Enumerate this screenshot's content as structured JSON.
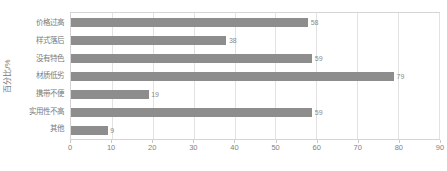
{
  "chart_data": {
    "type": "bar",
    "orientation": "horizontal",
    "title": "",
    "xlabel": "",
    "ylabel": "百分比/%",
    "categories": [
      "价格过高",
      "样式落后",
      "没有特色",
      "材质低劣",
      "携带不便",
      "实用性不高",
      "其他"
    ],
    "values": [
      58,
      38,
      59,
      79,
      19,
      59,
      9
    ],
    "data_labels": [
      "58",
      "38",
      "59",
      "79",
      "19",
      "59",
      "9"
    ],
    "xlim": [
      0,
      90
    ],
    "xticks": [
      0,
      10,
      20,
      30,
      40,
      50,
      60,
      70,
      80,
      90
    ],
    "xtick_labels": [
      "0",
      "10",
      "20",
      "30",
      "40",
      "50",
      "60",
      "70",
      "80",
      "90"
    ],
    "grid": true,
    "grid_axis": "x",
    "legend": false,
    "bar_color": "#8d8d8d",
    "plot_border_color": "#d4d4d4",
    "gridline_color": "#e2e2e2",
    "text_color": "#7f7f7f"
  }
}
